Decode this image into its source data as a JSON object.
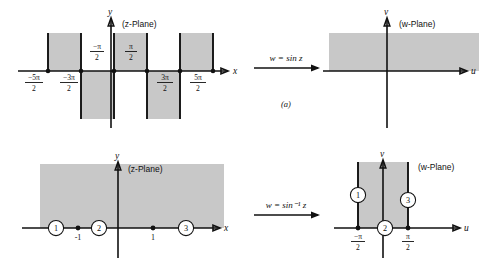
{
  "figure": {
    "caption_a": "(a)",
    "rows": [
      {
        "id": "row-a",
        "map_label": "w = sin z",
        "source": {
          "plane_label": "(z-Plane)",
          "x_axis_label": "x",
          "y_axis_label": "y",
          "tick_labels": [
            "-5π/2",
            "-3π/2",
            "-π/2",
            "π/2",
            "3π/2",
            "5π/2"
          ],
          "tick_values": [
            -2.5,
            -1.5,
            -0.5,
            0.5,
            1.5,
            2.5
          ],
          "region_description": "alternating vertical half-strips of width π"
        },
        "target": {
          "plane_label": "(w-Plane)",
          "x_axis_label": "u",
          "y_axis_label": "v",
          "region_description": "horizontal band in upper half plane"
        }
      },
      {
        "id": "row-b",
        "map_label": "w = sin⁻¹ z",
        "source": {
          "plane_label": "(z-Plane)",
          "x_axis_label": "x",
          "y_axis_label": "y",
          "tick_labels": [
            "-1",
            "1"
          ],
          "tick_values": [
            -1,
            1
          ],
          "markers": [
            "1",
            "2",
            "3"
          ],
          "region_description": "upper half plane"
        },
        "target": {
          "plane_label": "(w-Plane)",
          "x_axis_label": "u",
          "y_axis_label": "v",
          "tick_labels": [
            "-π/2",
            "π/2"
          ],
          "tick_values": [
            -0.5,
            0.5
          ],
          "markers": [
            "1",
            "2",
            "3"
          ],
          "region_description": "vertical strip -π/2 < u < π/2 in upper half plane"
        }
      }
    ]
  },
  "fractions": {
    "neg5pi2": {
      "num": "−5π",
      "den": "2"
    },
    "neg3pi2": {
      "num": "−3π",
      "den": "2"
    },
    "negpi2": {
      "num": "−π",
      "den": "2"
    },
    "pi2": {
      "num": "π",
      "den": "2"
    },
    "pi32": {
      "num": "3π",
      "den": "2"
    },
    "pi52": {
      "num": "5π",
      "den": "2"
    }
  },
  "colors": {
    "shade": "#b9b9b9",
    "ink": "#111111",
    "background": "#ffffff"
  }
}
